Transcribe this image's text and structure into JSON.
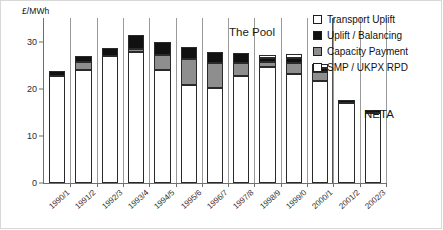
{
  "axis_unit_label": "£/MWh",
  "era_labels": {
    "pool": "The Pool",
    "neta": "NETA"
  },
  "legend": {
    "items": [
      {
        "label": "Transport Uplift",
        "color": "#ffffff",
        "key": "transport_uplift"
      },
      {
        "label": "Uplift / Balancing",
        "color": "#111111",
        "key": "uplift_balancing"
      },
      {
        "label": "Capacity Payment",
        "color": "#8e8e8e",
        "key": "capacity_payment"
      },
      {
        "label": "SMP / UKPX RPD",
        "color": "#ffffff",
        "key": "smp_ukpx_rpd"
      }
    ]
  },
  "chart_data": {
    "type": "bar",
    "stacked": true,
    "title": "",
    "xlabel": "",
    "ylabel": "£/MWh",
    "ylim": [
      0,
      35
    ],
    "yticks": [
      0,
      10,
      20,
      30
    ],
    "grid": false,
    "legend_position": "top-right",
    "categories": [
      "1990/1",
      "1991/2",
      "1992/3",
      "1993/4",
      "1994/5",
      "1995/6",
      "1996/7",
      "1997/8",
      "1998/9",
      "1999/0",
      "2000/1",
      "2001/2",
      "2002/3"
    ],
    "series": [
      {
        "name": "SMP / UKPX RPD",
        "color": "#ffffff",
        "values": [
          22.6,
          23.9,
          27.0,
          27.8,
          23.9,
          20.7,
          20.2,
          22.7,
          24.6,
          23.1,
          21.6,
          17.0,
          14.8
        ]
      },
      {
        "name": "Capacity Payment",
        "color": "#8e8e8e",
        "values": [
          0.0,
          1.8,
          0.0,
          0.7,
          3.2,
          5.6,
          5.3,
          2.7,
          1.1,
          2.4,
          2.0,
          0.0,
          0.0
        ]
      },
      {
        "name": "Uplift / Balancing",
        "color": "#111111",
        "values": [
          1.2,
          1.3,
          1.7,
          2.8,
          2.9,
          2.6,
          2.2,
          2.1,
          0.9,
          1.0,
          0.8,
          0.6,
          0.7
        ]
      },
      {
        "name": "Transport Uplift",
        "color": "#ffffff",
        "values": [
          0.0,
          0.0,
          0.0,
          0.0,
          0.0,
          0.0,
          0.0,
          0.0,
          0.6,
          0.8,
          0.8,
          0.0,
          0.0
        ]
      }
    ],
    "totals": [
      23.8,
      27.0,
      28.7,
      31.3,
      30.0,
      28.9,
      27.7,
      27.5,
      27.2,
      27.3,
      25.2,
      17.6,
      15.5
    ],
    "era_divider_after_category": "2000/1",
    "annotations": [
      {
        "text": "The Pool",
        "position": "above-bars-left-of-divider"
      },
      {
        "text": "NETA",
        "position": "right-of-divider"
      }
    ]
  }
}
